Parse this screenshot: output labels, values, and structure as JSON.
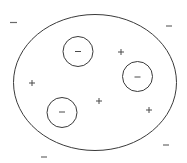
{
  "diagram": {
    "title": "",
    "colors": {
      "line": "#3a3a3a",
      "sign": "#4a4a4a",
      "outer_sign": "#6a6a6a",
      "background": "#ffffff"
    },
    "outer_body": {
      "shape": "ellipse",
      "label": ""
    },
    "enclosed_charges": [
      {
        "id": "enclosed-negative-1",
        "symbol": "minus",
        "enclosed_in_circle": true
      },
      {
        "id": "enclosed-negative-2",
        "symbol": "minus",
        "enclosed_in_circle": true
      },
      {
        "id": "enclosed-negative-3",
        "symbol": "minus",
        "enclosed_in_circle": true
      }
    ],
    "inner_positive_charges": [
      {
        "id": "positive-1",
        "symbol": "plus"
      },
      {
        "id": "positive-2",
        "symbol": "plus"
      },
      {
        "id": "positive-3",
        "symbol": "plus"
      },
      {
        "id": "positive-4",
        "symbol": "plus"
      }
    ],
    "outer_negative_charges": [
      {
        "id": "outer-negative-1",
        "symbol": "minus"
      },
      {
        "id": "outer-negative-2",
        "symbol": "minus"
      },
      {
        "id": "outer-negative-3",
        "symbol": "minus"
      },
      {
        "id": "outer-negative-4",
        "symbol": "minus"
      }
    ],
    "counts": {
      "enclosed_negative": 3,
      "inner_positive": 4,
      "outer_negative": 4
    }
  }
}
